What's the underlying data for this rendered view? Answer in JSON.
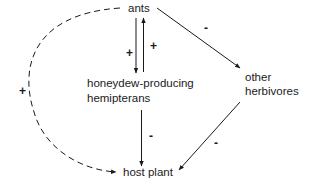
{
  "diagram": {
    "type": "ecological interaction web",
    "nodes": {
      "ants": "ants",
      "hemipterans_line1": "honeydew-producing",
      "hemipterans_line2": "hemipterans",
      "herbivores_line1": "other",
      "herbivores_line2": "herbivores",
      "host_plant": "host plant"
    },
    "edges": [
      {
        "from": "ants",
        "to": "honeydew-producing hemipterans",
        "sign": "+",
        "style": "solid"
      },
      {
        "from": "honeydew-producing hemipterans",
        "to": "ants",
        "sign": "+",
        "style": "solid"
      },
      {
        "from": "ants",
        "to": "other herbivores",
        "sign": "-",
        "style": "solid"
      },
      {
        "from": "honeydew-producing hemipterans",
        "to": "host plant",
        "sign": "-",
        "style": "solid"
      },
      {
        "from": "other herbivores",
        "to": "host plant",
        "sign": "-",
        "style": "solid"
      },
      {
        "from": "ants",
        "to": "host plant",
        "sign": "+",
        "style": "dashed"
      }
    ],
    "signs": {
      "ants_to_hemipterans": "+",
      "hemipterans_to_ants": "+",
      "ants_to_herbivores": "-",
      "hemipterans_to_plant": "-",
      "herbivores_to_plant": "-",
      "ants_to_plant_indirect": "+"
    }
  }
}
